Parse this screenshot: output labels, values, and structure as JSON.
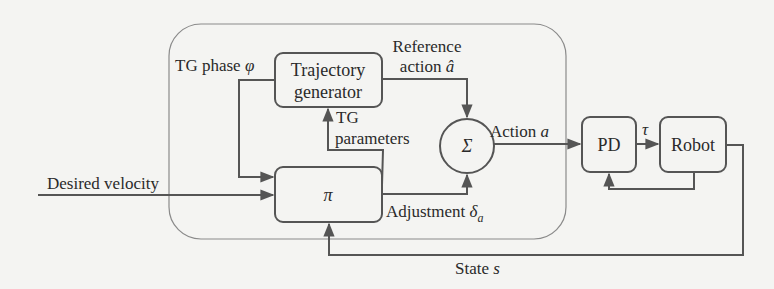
{
  "colors": {
    "background": "#f4f4f2",
    "line": "#555555",
    "outer_frame": "#8a8a8a",
    "text": "#2a2a2a"
  },
  "blocks": {
    "trajectory_generator": {
      "line1": "Trajectory",
      "line2": "generator"
    },
    "policy": {
      "label": "π"
    },
    "sum": {
      "label": "Σ"
    },
    "pd": {
      "label": "PD"
    },
    "robot": {
      "label": "Robot"
    }
  },
  "signals": {
    "tg_phase": {
      "text": "TG phase ",
      "symbol": "φ"
    },
    "reference_action": {
      "line1": "Reference",
      "line2_text": "action ",
      "symbol": "â"
    },
    "tg_parameters": {
      "line1": "TG",
      "line2": "parameters"
    },
    "action": {
      "text": "Action ",
      "symbol": "a"
    },
    "adjustment": {
      "text": "Adjustment ",
      "symbol": "δ",
      "subscript": "a"
    },
    "torque": {
      "symbol": "τ"
    },
    "desired_velocity": {
      "text": "Desired velocity"
    },
    "state": {
      "text": "State ",
      "symbol": "s"
    }
  }
}
